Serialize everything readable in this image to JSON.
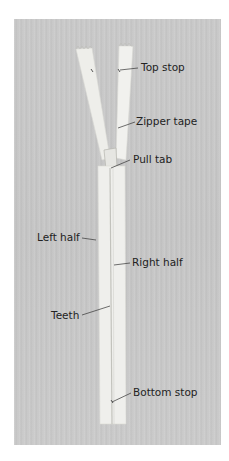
{
  "figure": {
    "subject": "zipper",
    "labels": {
      "top_stop": "Top stop",
      "zipper_tape": "Zipper tape",
      "pull_tab": "Pull tab",
      "left_half": "Left half",
      "right_half": "Right half",
      "teeth": "Teeth",
      "bottom_stop": "Bottom stop"
    },
    "colors": {
      "background": "#c6c6c6",
      "tape": "#efefec",
      "leader_line": "#333333"
    }
  }
}
